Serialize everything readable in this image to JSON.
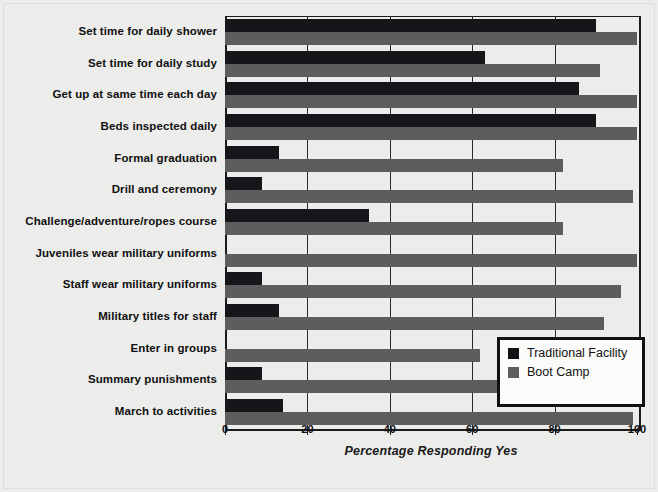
{
  "chart_data": {
    "type": "bar",
    "orientation": "horizontal",
    "title": "",
    "xlabel": "Percentage Responding Yes",
    "ylabel": "",
    "xlim": [
      0,
      100
    ],
    "xticks": [
      0,
      20,
      40,
      60,
      80,
      100
    ],
    "xticklabels": [
      "0",
      "20",
      "40",
      "60",
      "80",
      "100"
    ],
    "grid": "vertical",
    "legend_position": "lower-right-inset",
    "categories": [
      "Set time for daily shower",
      "Set time for daily study",
      "Get up at same time each day",
      "Beds inspected daily",
      "Formal graduation",
      "Drill and ceremony",
      "Challenge/adventure/ropes course",
      "Juveniles wear military uniforms",
      "Staff wear military uniforms",
      "Military titles for staff",
      "Enter in groups",
      "Summary punishments",
      "March to activities"
    ],
    "series": [
      {
        "name": "Traditional Facility",
        "color": "#16161a",
        "values": [
          90,
          63,
          86,
          90,
          13,
          9,
          35,
          0,
          9,
          13,
          0,
          9,
          14
        ]
      },
      {
        "name": "Boot Camp",
        "color": "#5d5d5e",
        "values": [
          100,
          91,
          100,
          100,
          82,
          99,
          82,
          100,
          96,
          92,
          62,
          71,
          99
        ]
      }
    ]
  },
  "legend": {
    "items": [
      {
        "label": "Traditional Facility",
        "swatch": "trad"
      },
      {
        "label": "Boot Camp",
        "swatch": "boot"
      }
    ]
  }
}
